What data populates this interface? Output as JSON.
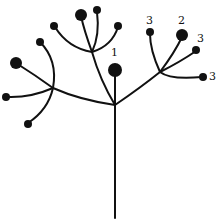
{
  "diagram": {
    "type": "compound-umbel-inflorescence",
    "labels": {
      "center": "1",
      "right_large": "2",
      "right_a": "3",
      "right_b": "3",
      "right_c": "3"
    },
    "colors": {
      "stroke": "#111111",
      "node": "#111111",
      "background": "#ffffff"
    },
    "caption": ""
  }
}
